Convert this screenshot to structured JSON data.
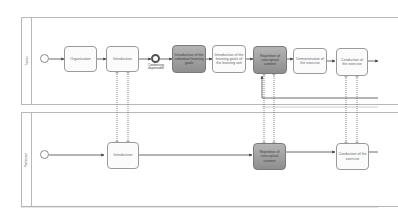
{
  "pools": [
    {
      "id": "trainer",
      "label": "Trainer"
    },
    {
      "id": "participant",
      "label": "Participant"
    }
  ],
  "trainer_lane": {
    "tasks": [
      {
        "label": "Organisation",
        "style": "light"
      },
      {
        "label": "Introduction",
        "style": "light"
      },
      {
        "label": "Introduction of the individual learning goals",
        "style": "dark"
      },
      {
        "label": "Introduction of the learning goals of the learning unit",
        "style": "light"
      },
      {
        "label": "Repetition of conceptual content",
        "style": "dark"
      },
      {
        "label": "Demonstration of the exercise",
        "style": "light"
      },
      {
        "label": "Conduction of the exercise",
        "style": "light"
      }
    ],
    "intermediate_event": {
      "caption_line1": "Condensing",
      "caption_line2": "dispensable"
    }
  },
  "participant_lane": {
    "tasks": [
      {
        "label": "Introduction",
        "style": "light"
      },
      {
        "label": "Repetition of conceptual content",
        "style": "dark"
      },
      {
        "label": "Conduction of the exercise",
        "style": "light"
      }
    ]
  },
  "colors": {
    "line": "#444444",
    "pool_border": "#b8b8b8",
    "dark_task": "#9e9e9e",
    "light_task": "#fbfbfb"
  }
}
